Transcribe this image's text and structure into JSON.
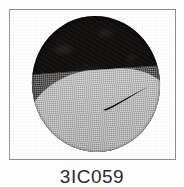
{
  "plate": {
    "caption": "3IC059",
    "frame": {
      "label": "figure-frame",
      "border_color": "#8c8c8c",
      "background": "#ffffff"
    },
    "specimen": {
      "name": "specimen-photograph",
      "description": "elliptical specimen, dark upper body with light grey lower lobe and a thin curved slit",
      "dark_color": "#141211",
      "light_color": "#b3b3b3",
      "slit_color": "#0d0c0b",
      "outline_color": "#6f6f6f"
    }
  }
}
